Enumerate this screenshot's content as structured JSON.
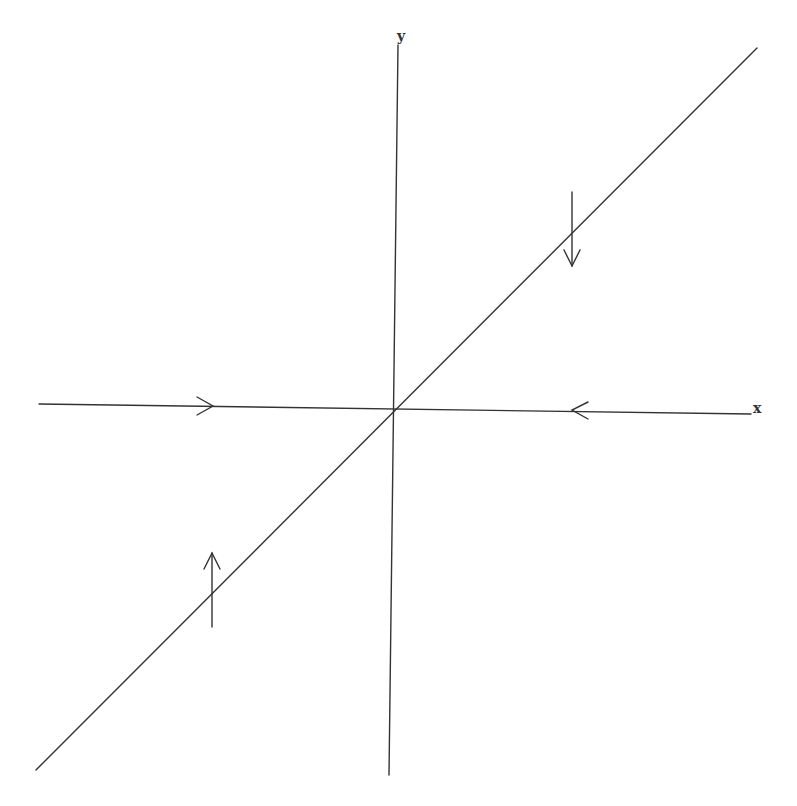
{
  "diagram": {
    "type": "phase-portrait",
    "axes": {
      "x_label": "x",
      "y_label": "y"
    },
    "lines": [
      {
        "name": "x-axis",
        "flow": "toward origin"
      },
      {
        "name": "y-axis",
        "flow": "none"
      },
      {
        "name": "diagonal-y-equals-x",
        "flow": "away from origin (vertical arrows)"
      }
    ],
    "arrows": [
      {
        "name": "arrow-right-on-x-axis",
        "direction": "right",
        "position": "negative x side"
      },
      {
        "name": "arrow-left-on-x-axis",
        "direction": "left",
        "position": "positive x side"
      },
      {
        "name": "arrow-down-upper-right",
        "direction": "down",
        "position": "crossing diagonal, first quadrant"
      },
      {
        "name": "arrow-up-lower-left",
        "direction": "up",
        "position": "crossing diagonal, third quadrant"
      }
    ],
    "colors": {
      "line": "#333333",
      "background": "#ffffff"
    }
  }
}
